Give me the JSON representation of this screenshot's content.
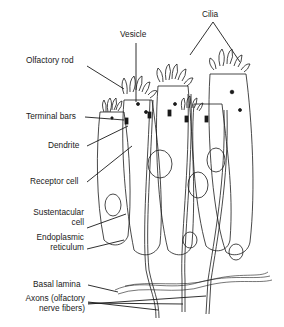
{
  "diagram": {
    "labels": {
      "vesicle": "Vesicle",
      "cilia": "Cilia",
      "olfactory_rod": "Olfactory rod",
      "terminal_bars": "Terminal bars",
      "dendrite": "Dendrite",
      "receptor_cell": "Receptor cell",
      "sustentacular_cell_line1": "Sustentacular",
      "sustentacular_cell_line2": "cell",
      "endoplasmic_reticulum_line1": "Endoplasmic",
      "endoplasmic_reticulum_line2": "reticulum",
      "basal_lamina": "Basal lamina",
      "axons_line1": "Axons (olfactory",
      "axons_line2": "nerve fibers)"
    },
    "colors": {
      "ink": "#1a1a1a",
      "background": "#ffffff"
    }
  }
}
